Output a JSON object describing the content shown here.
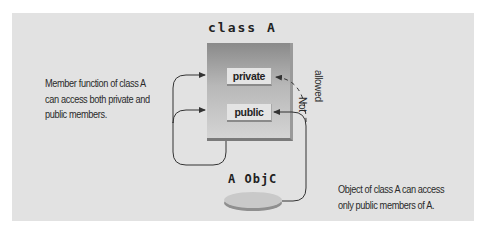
{
  "diagram": {
    "class_title": "class A",
    "members": {
      "private": "private",
      "public": "public"
    },
    "object_label": "A ObjC",
    "not_allowed": {
      "line1": "Not",
      "line2": "allowed"
    },
    "notes": {
      "left": [
        "Member function of class A",
        "can access both private and",
        "public members."
      ],
      "right": [
        "Object of class A can access",
        "only public members of A."
      ]
    },
    "colors": {
      "panel": "#e2e2e2",
      "box_top": "#8a8a8a",
      "box_bottom": "#d4d4d4",
      "member_fill": "#e4e4e4",
      "ellipse_fill": "#c9c9c9",
      "line": "#333333"
    }
  }
}
